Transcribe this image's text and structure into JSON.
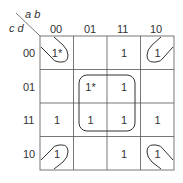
{
  "kmap": {
    "row_var": "c d",
    "col_var": "a b",
    "col_headers": [
      "00",
      "01",
      "11",
      "10"
    ],
    "row_headers": [
      "00",
      "01",
      "11",
      "10"
    ],
    "cells": [
      [
        "1*",
        "",
        "1",
        "1"
      ],
      [
        "",
        "1*",
        "1",
        ""
      ],
      [
        "1",
        "1",
        "1",
        "1"
      ],
      [
        "1",
        "",
        "1",
        "1"
      ]
    ],
    "groups": [
      {
        "name": "center-quad",
        "cells": [
          "01-01",
          "01-11",
          "11-01",
          "11-11"
        ]
      },
      {
        "name": "corners",
        "cells": [
          "00-00",
          "00-10",
          "10-00",
          "10-10"
        ]
      }
    ],
    "line_color": "#555555"
  }
}
